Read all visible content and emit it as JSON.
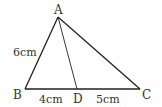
{
  "diagram": {
    "points": {
      "A": {
        "label": "A",
        "x": 58,
        "y": 17
      },
      "B": {
        "label": "B",
        "x": 25,
        "y": 89
      },
      "C": {
        "label": "C",
        "x": 140,
        "y": 89
      },
      "D": {
        "label": "D",
        "x": 77,
        "y": 89
      }
    },
    "segments": [
      {
        "from": "A",
        "to": "B",
        "length_label": "6cm"
      },
      {
        "from": "B",
        "to": "D",
        "length_label": "4cm"
      },
      {
        "from": "D",
        "to": "C",
        "length_label": "5cm"
      },
      {
        "from": "A",
        "to": "C",
        "length_label": ""
      },
      {
        "from": "A",
        "to": "D",
        "length_label": ""
      }
    ],
    "labels": {
      "A": "A",
      "B": "B",
      "C": "C",
      "D": "D",
      "AB": "6cm",
      "BD": "4cm",
      "DC": "5cm"
    },
    "colors": {
      "stroke": "#222222",
      "text": "#333333",
      "background": "#ffffff"
    }
  }
}
